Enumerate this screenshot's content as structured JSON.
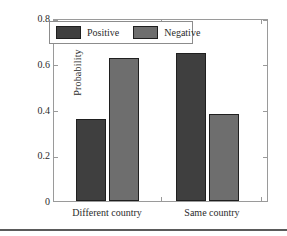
{
  "chart_data": {
    "type": "bar",
    "title": "",
    "xlabel": "",
    "ylabel": "Probability",
    "categories": [
      "Different country",
      "Same country"
    ],
    "series": [
      {
        "name": "Positive",
        "color": "#3f3f3f",
        "values": [
          0.36,
          0.645
        ]
      },
      {
        "name": "Negative",
        "color": "#6e6e6e",
        "values": [
          0.625,
          0.38
        ]
      }
    ],
    "ylim": [
      0,
      0.8
    ],
    "yticks": [
      "0",
      "0.2",
      "0.4",
      "0.6",
      "0.8"
    ],
    "ytick_values": [
      0,
      0.2,
      0.4,
      0.6,
      0.8
    ],
    "grid": false,
    "legend_position": "top-left"
  },
  "axes": {
    "y_label": "Probability",
    "y_ticks": [
      "0.8",
      "0.6",
      "0.4",
      "0.2",
      "0"
    ],
    "x_ticks": [
      "Different country",
      "Same country"
    ]
  },
  "legend": {
    "entries": [
      {
        "label": "Positive"
      },
      {
        "label": "Negative"
      }
    ]
  }
}
